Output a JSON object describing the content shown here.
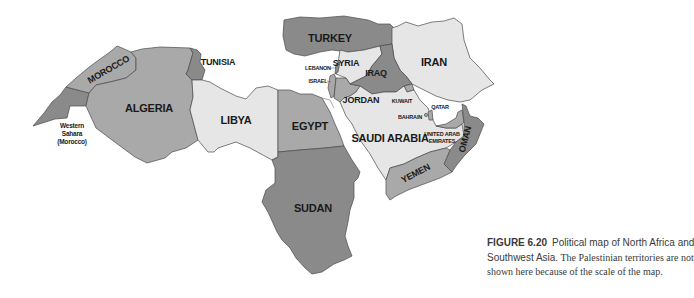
{
  "map": {
    "title": "Political map of North Africa and Southwest Asia",
    "colors": {
      "dark": "#8a8a8a",
      "medium": "#a9a9a9",
      "light": "#e6e6e6",
      "background": "#ffffff",
      "border": "#4a4a4a"
    },
    "countries": [
      {
        "name": "MOROCCO",
        "shade": "medium"
      },
      {
        "name": "Western Sahara (Morocco)",
        "shade": "dark"
      },
      {
        "name": "ALGERIA",
        "shade": "medium"
      },
      {
        "name": "TUNISIA",
        "shade": "dark"
      },
      {
        "name": "LIBYA",
        "shade": "light"
      },
      {
        "name": "EGYPT",
        "shade": "medium"
      },
      {
        "name": "SUDAN",
        "shade": "dark"
      },
      {
        "name": "TURKEY",
        "shade": "dark"
      },
      {
        "name": "SYRIA",
        "shade": "light"
      },
      {
        "name": "LEBANON",
        "shade": "dark"
      },
      {
        "name": "ISRAEL",
        "shade": "medium"
      },
      {
        "name": "JORDAN",
        "shade": "medium"
      },
      {
        "name": "IRAQ",
        "shade": "dark"
      },
      {
        "name": "IRAN",
        "shade": "light"
      },
      {
        "name": "KUWAIT",
        "shade": "medium"
      },
      {
        "name": "SAUDI ARABIA",
        "shade": "light"
      },
      {
        "name": "BAHRAIN",
        "shade": "medium"
      },
      {
        "name": "QATAR",
        "shade": "medium"
      },
      {
        "name": "UNITED ARAB EMIRATES",
        "shade": "medium"
      },
      {
        "name": "OMAN",
        "shade": "dark"
      },
      {
        "name": "YEMEN",
        "shade": "medium"
      }
    ],
    "labels": {
      "morocco": "MOROCCO",
      "western_sahara_1": "Western",
      "western_sahara_2": "Sahara",
      "western_sahara_3": "(Morocco)",
      "algeria": "ALGERIA",
      "tunisia": "TUNISIA",
      "libya": "LIBYA",
      "egypt": "EGYPT",
      "sudan": "SUDAN",
      "turkey": "TURKEY",
      "syria": "SYRIA",
      "lebanon": "LEBANON",
      "israel": "ISRAEL",
      "jordan": "JORDAN",
      "iraq": "IRAQ",
      "iran": "IRAN",
      "kuwait": "KUWAIT",
      "saudi_arabia": "SAUDI ARABIA",
      "bahrain": "BAHRAIN",
      "qatar": "QATAR",
      "uae_1": "UNITED ARAB",
      "uae_2": "EMIRATES",
      "oman": "OMAN",
      "yemen": "YEMEN"
    }
  },
  "caption": {
    "figure_number": "FIGURE 6.20",
    "line1_rest": "Political map of North Africa and",
    "line2_sans": "Southwest Asia.",
    "line2_serif": "The Palestinian territories are not",
    "line3": "shown here because of the scale of the map."
  }
}
